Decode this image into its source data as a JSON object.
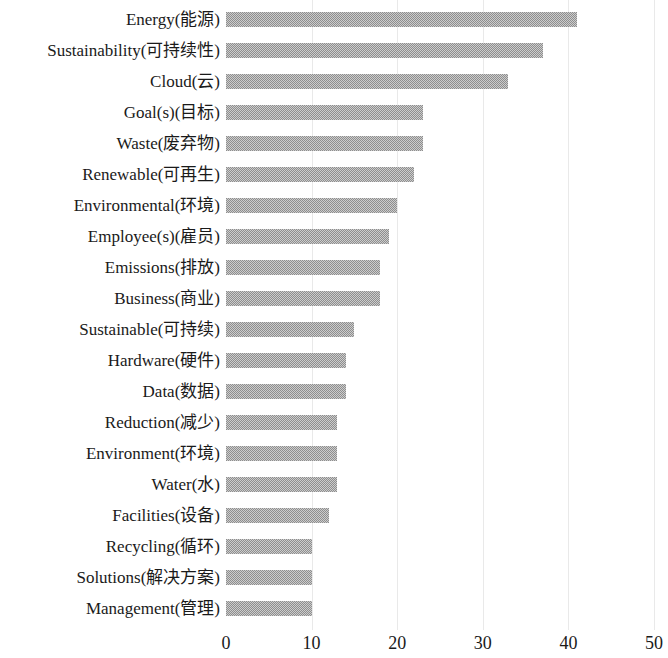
{
  "chart_data": {
    "type": "bar",
    "orientation": "horizontal",
    "title": "",
    "subtitle": "",
    "xlabel": "",
    "ylabel": "",
    "xlim": [
      0,
      50
    ],
    "xticks": [
      0,
      10,
      20,
      30,
      40,
      50
    ],
    "xtick_labels": [
      "0",
      "10",
      "20",
      "30",
      "40",
      "50"
    ],
    "grid": true,
    "grid_axis": "x",
    "legend": false,
    "legend_position": "none",
    "bar_color": "#8e8e8e",
    "grid_color": "#e9e9e9",
    "text_color": "#1a1a1a",
    "categories": [
      "Energy(能源)",
      "Sustainability(可持续性)",
      "Cloud(云)",
      "Goal(s)(目标)",
      "Waste(废弃物)",
      "Renewable(可再生)",
      "Environmental(环境)",
      "Employee(s)(雇员)",
      "Emissions(排放)",
      "Business(商业)",
      "Sustainable(可持续)",
      "Hardware(硬件)",
      "Data(数据)",
      "Reduction(减少)",
      "Environment(环境)",
      "Water(水)",
      "Facilities(设备)",
      "Recycling(循环)",
      "Solutions(解决方案)",
      "Management(管理)"
    ],
    "values": [
      41,
      37,
      33,
      23,
      23,
      22,
      20,
      19,
      18,
      18,
      15,
      14,
      14,
      13,
      13,
      13,
      12,
      10,
      10,
      10
    ]
  }
}
